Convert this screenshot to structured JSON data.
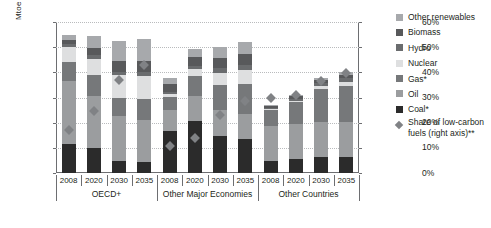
{
  "chart_data": {
    "type": "bar",
    "title": "",
    "subtitle": "",
    "xlabel": "",
    "ylabel": "Mtoe",
    "y2label": "",
    "ylim": [
      0,
      6000
    ],
    "y2lim": [
      0,
      60
    ],
    "grid": true,
    "legend_position": "right",
    "stacked": true,
    "y_ticks": [
      "0",
      "1 000",
      "2 000",
      "3 000",
      "4 000",
      "5 000",
      "6 000"
    ],
    "y_tick_values": [
      0,
      1000,
      2000,
      3000,
      4000,
      5000,
      6000
    ],
    "y2_ticks": [
      "0%",
      "10%",
      "20%",
      "30%",
      "40%",
      "50%",
      "60%"
    ],
    "y2_tick_values": [
      0,
      10,
      20,
      30,
      40,
      50,
      60
    ],
    "categories": [
      "2008",
      "2020",
      "2030",
      "2035",
      "2008",
      "2020",
      "2030",
      "2035",
      "2008",
      "2020",
      "2030",
      "2035"
    ],
    "groups": [
      {
        "label": "OECD+",
        "start": 0,
        "count": 4
      },
      {
        "label": "Other Major Economies",
        "start": 4,
        "count": 4
      },
      {
        "label": "Other Countries",
        "start": 8,
        "count": 4
      }
    ],
    "series": [
      {
        "name": "Coal*",
        "color": "#2b2b2b",
        "values": [
          1150,
          1010,
          480,
          430,
          1650,
          2070,
          1470,
          1340,
          470,
          560,
          620,
          640
        ]
      },
      {
        "name": "Oil",
        "color": "#9b9d9f",
        "values": [
          2500,
          2040,
          1800,
          1670,
          850,
          980,
          1020,
          990,
          1400,
          1380,
          1410,
          1370
        ]
      },
      {
        "name": "Gas*",
        "color": "#76787a",
        "values": [
          760,
          850,
          700,
          830,
          530,
          800,
          1000,
          1200,
          630,
          880,
          1290,
          1460
        ]
      },
      {
        "name": "Nuclear",
        "color": "#dedfe0",
        "values": [
          600,
          650,
          900,
          940,
          110,
          270,
          480,
          560,
          30,
          50,
          120,
          140
        ]
      },
      {
        "name": "Hydro",
        "color": "#6a6c6e",
        "values": [
          110,
          130,
          150,
          160,
          80,
          140,
          190,
          210,
          60,
          90,
          130,
          150
        ]
      },
      {
        "name": "Biomass",
        "color": "#58595b",
        "values": [
          180,
          280,
          410,
          430,
          330,
          360,
          400,
          420,
          100,
          110,
          130,
          140
        ]
      },
      {
        "name": "Other renewables",
        "color": "#a7a9ac",
        "values": [
          180,
          480,
          820,
          860,
          220,
          310,
          440,
          480,
          10,
          40,
          90,
          110
        ]
      }
    ],
    "marker_series": {
      "name": "Share of low-carbon fuels (right axis)**",
      "color": "#808285",
      "axis": "right",
      "unit": "%",
      "values": [
        18.5,
        26.0,
        38.5,
        44.5,
        12.0,
        15.5,
        24.5,
        30.0,
        31.0,
        32.5,
        38.0,
        41.0
      ]
    },
    "footnote_markers": [
      "*",
      "**"
    ]
  },
  "legend": {
    "items": [
      {
        "label": "Other renewables",
        "swatch": "#a7a9ac",
        "shape": "square"
      },
      {
        "label": "Biomass",
        "swatch": "#58595b",
        "shape": "square"
      },
      {
        "label": "Hydro",
        "swatch": "#6a6c6e",
        "shape": "square"
      },
      {
        "label": "Nuclear",
        "swatch": "#dedfe0",
        "shape": "square"
      },
      {
        "label": "Gas*",
        "swatch": "#76787a",
        "shape": "square"
      },
      {
        "label": "Oil",
        "swatch": "#9b9d9f",
        "shape": "square"
      },
      {
        "label": "Coal*",
        "swatch": "#2b2b2b",
        "shape": "square"
      },
      {
        "label": "Share of low-carbon fuels (right axis)**",
        "swatch": "#808285",
        "shape": "diamond"
      }
    ]
  }
}
